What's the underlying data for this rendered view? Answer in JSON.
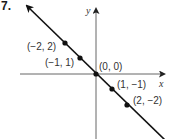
{
  "problem": {
    "number": "7."
  },
  "graph": {
    "x_axis_label": "x",
    "y_axis_label": "y",
    "line": {
      "equation": "y = -x",
      "slope": -1,
      "intercept": 0
    },
    "points": [
      {
        "label": "(−2, 2)",
        "x": -2,
        "y": 2
      },
      {
        "label": "(−1, 1)",
        "x": -1,
        "y": 1
      },
      {
        "label": "(0, 0)",
        "x": 0,
        "y": 0
      },
      {
        "label": "(1, −1)",
        "x": 1,
        "y": -1
      },
      {
        "label": "(2, −2)",
        "x": 2,
        "y": -2
      }
    ],
    "colors": {
      "line": "#111111",
      "axis": "#555555",
      "point": "#111111",
      "text": "#333333"
    }
  }
}
